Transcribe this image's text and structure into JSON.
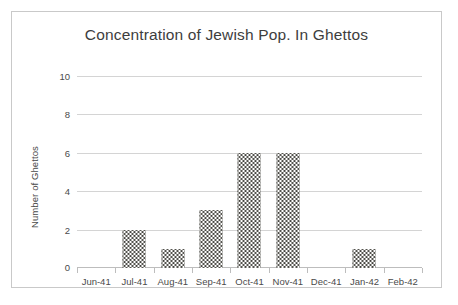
{
  "chart_data": {
    "type": "bar",
    "title": "Concentration of Jewish Pop. In Ghettos",
    "xlabel": "",
    "ylabel": "Number of Ghettos",
    "categories": [
      "Jun-41",
      "Jul-41",
      "Aug-41",
      "Sep-41",
      "Oct-41",
      "Nov-41",
      "Dec-41",
      "Jan-42",
      "Feb-42"
    ],
    "values": [
      0,
      2,
      1,
      3,
      6,
      6,
      0,
      1,
      0
    ],
    "ylim": [
      0,
      10
    ],
    "yticks": [
      0,
      2,
      4,
      6,
      8,
      10
    ],
    "ytick_labels": [
      "0",
      "2",
      "4",
      "6",
      "8",
      "10"
    ],
    "grid": "horizontal",
    "legend": "none",
    "bar_fill": "#55544f",
    "gridline_color": "#d4d4d4",
    "text_color": "#4a4a4a",
    "border_color": "#c9c9c9"
  }
}
